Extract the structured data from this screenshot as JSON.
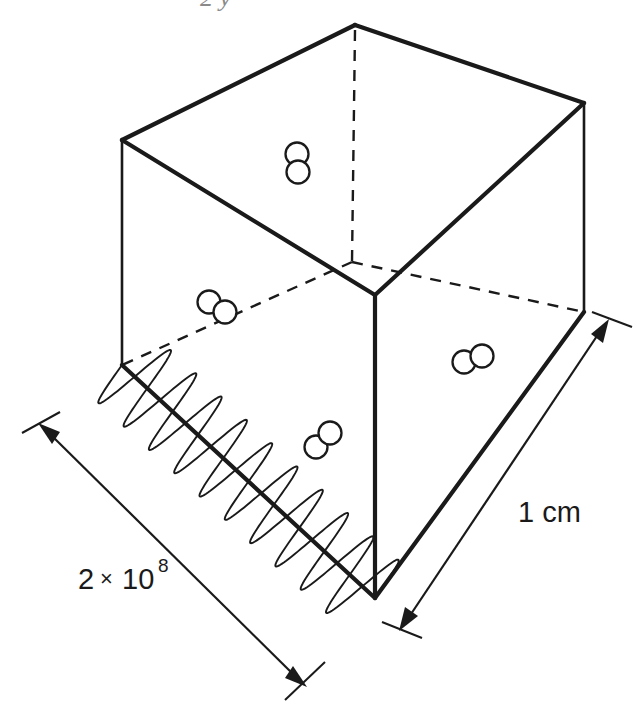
{
  "figure": {
    "name": "gas-in-cube-diagram",
    "top_partial_text": "2 y",
    "ink_color": "#1a1a1a",
    "background_color": "#ffffff"
  },
  "labels": {
    "depth": {
      "text": "1 cm",
      "name": "depth-dimension-label"
    },
    "length": {
      "mantissa": "2",
      "times": "×",
      "base": "10",
      "exponent": "8",
      "full": "2 × 10⁸",
      "name": "length-dimension-label"
    }
  },
  "cube": {
    "vertices": {
      "top": [
        355,
        25
      ],
      "left_top": [
        122,
        140
      ],
      "right_top": [
        584,
        103
      ],
      "front_top": [
        375,
        295
      ],
      "left_bottom": [
        122,
        365
      ],
      "right_bottom": [
        584,
        312
      ],
      "front_bottom": [
        375,
        598
      ],
      "back_hidden": [
        330,
        228
      ]
    },
    "edge_style_solid": "solid",
    "edge_style_hidden": "dashed"
  },
  "molecules": [
    {
      "id": "molecule-top-face",
      "cx": 297,
      "cy": 163,
      "orientation": "vertical"
    },
    {
      "id": "molecule-left-rear",
      "cx": 217,
      "cy": 307,
      "orientation": "diagonal"
    },
    {
      "id": "molecule-right-face",
      "cx": 473,
      "cy": 360,
      "orientation": "horizontal"
    },
    {
      "id": "molecule-front-lower",
      "cx": 323,
      "cy": 440,
      "orientation": "diagonal-up"
    }
  ],
  "wave": {
    "name": "electromagnetic-wave",
    "cycles": 10,
    "start": [
      122,
      365
    ],
    "end": [
      375,
      598
    ],
    "amplitude": 44
  },
  "dimensions": [
    {
      "id": "length-dimension-arrow",
      "from": [
        40,
        425
      ],
      "to": [
        305,
        685
      ],
      "double_headed": true
    },
    {
      "id": "depth-dimension-arrow",
      "from": [
        609,
        322
      ],
      "to": [
        400,
        628
      ],
      "double_headed": true
    }
  ]
}
